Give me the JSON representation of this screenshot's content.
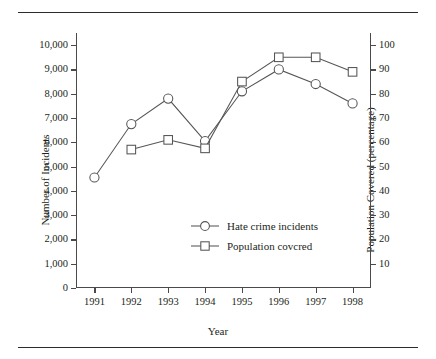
{
  "figure": {
    "xlabel": "Year",
    "ylabel_left": "Number of Incidents",
    "ylabel_right": "Population Covered (percentage)"
  },
  "legend": {
    "items": [
      {
        "label": "Hate crime incidents",
        "marker": "circle-marker-icon"
      },
      {
        "label": "Population covcred",
        "marker": "square-marker-icon"
      }
    ]
  },
  "axes": {
    "x_ticklabels": [
      "1991",
      "1992",
      "1993",
      "1994",
      "1995",
      "1996",
      "1997",
      "1998"
    ],
    "y_left_ticklabels": [
      "0",
      "1,000",
      "2,000",
      "3,000",
      "4,000",
      "5,000",
      "6,000",
      "7,000",
      "8,000",
      "9,000",
      "10,000"
    ],
    "y_right_ticklabels": [
      "10",
      "20",
      "30",
      "40",
      "50",
      "60",
      "70",
      "80",
      "90",
      "100"
    ]
  },
  "chart_data": {
    "type": "line",
    "title": "",
    "xlabel": "Year",
    "ylabel": "Number of Incidents",
    "ylabel_secondary": "Population Covered (percentage)",
    "x": [
      1991,
      1992,
      1993,
      1994,
      1995,
      1996,
      1997,
      1998
    ],
    "categories": [
      "1991",
      "1992",
      "1993",
      "1994",
      "1995",
      "1996",
      "1997",
      "1998"
    ],
    "xlim": [
      1990.5,
      1998.5
    ],
    "ylim": [
      0,
      10500
    ],
    "ylim_secondary": [
      0,
      105
    ],
    "grid": false,
    "legend_position": "center",
    "series": [
      {
        "name": "Hate crime incidents",
        "axis": "left",
        "marker": "circle",
        "values": [
          4550,
          6750,
          7800,
          6050,
          8100,
          9000,
          8400,
          7600
        ]
      },
      {
        "name": "Population covcred",
        "axis": "right",
        "marker": "square",
        "values": [
          null,
          57,
          61,
          57.5,
          85,
          95,
          95,
          89
        ]
      }
    ]
  },
  "colors": {
    "line": "#555555",
    "text": "#231f20",
    "rule": "#2b2b2b"
  }
}
